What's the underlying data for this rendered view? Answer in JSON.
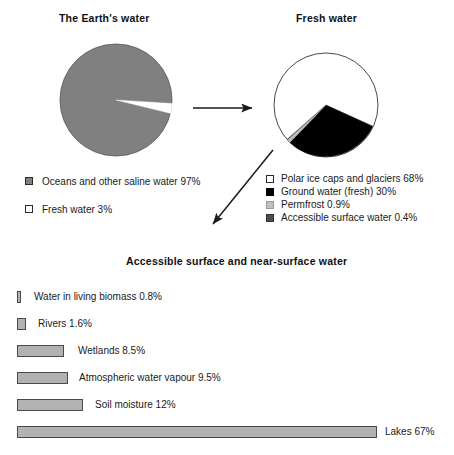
{
  "chart_data": [
    {
      "type": "pie",
      "title": "The Earth's water",
      "xlabel": "",
      "ylabel": "",
      "grid": false,
      "legend_position": "below",
      "labels": [
        "Oceans and other saline water",
        "Fresh water"
      ],
      "values": [
        97,
        3
      ],
      "units": "%",
      "colors": [
        "#808080",
        "#ffffff"
      ],
      "legend": [
        {
          "label": "Oceans and other saline water 97%",
          "color": "#808080"
        },
        {
          "label": "Fresh water 3%",
          "color": "#ffffff"
        }
      ]
    },
    {
      "type": "pie",
      "title": "Fresh water",
      "xlabel": "",
      "ylabel": "",
      "grid": false,
      "legend_position": "below",
      "labels": [
        "Polar ice caps and glaciers",
        "Ground water (fresh)",
        "Permfrost",
        "Accessible surface water"
      ],
      "values": [
        68,
        30,
        0.9,
        0.4
      ],
      "units": "%",
      "colors": [
        "#ffffff",
        "#000000",
        "#bfbfbf",
        "#4d4d4d"
      ],
      "legend": [
        {
          "label": "Polar ice caps and glaciers 68%",
          "color": "#ffffff"
        },
        {
          "label": "Ground water (fresh) 30%",
          "color": "#000000"
        },
        {
          "label": "Permfrost 0.9%",
          "color": "#bfbfbf"
        },
        {
          "label": "Accessible surface water 0.4%",
          "color": "#4d4d4d"
        }
      ]
    },
    {
      "type": "bar",
      "orientation": "horizontal",
      "title": "Accessible surface and near-surface water",
      "xlabel": "",
      "ylabel": "",
      "grid": false,
      "xlim": [
        0,
        67
      ],
      "units": "%",
      "bar_color": "#b2b2b2",
      "categories": [
        "Water in living biomass",
        "Rivers",
        "Wetlands",
        "Atmospheric water vapour",
        "Soil moisture",
        "Lakes"
      ],
      "values": [
        0.8,
        1.6,
        8.5,
        9.5,
        12,
        67
      ],
      "bars": [
        {
          "label": "Water in living biomass 0.8%",
          "value": 0.8,
          "px_width": 4
        },
        {
          "label": "Rivers 1.6%",
          "value": 1.6,
          "px_width": 9
        },
        {
          "label": "Wetlands 8.5%",
          "value": 8.5,
          "px_width": 47
        },
        {
          "label": "Atmospheric water vapour 9.5%",
          "value": 9.5,
          "px_width": 51
        },
        {
          "label": "Soil moisture 12%",
          "value": 12,
          "px_width": 66
        },
        {
          "label": "Lakes 67%",
          "value": 67,
          "px_width": 360
        }
      ]
    }
  ],
  "titles": {
    "earth": "The Earth's water",
    "fresh": "Fresh water",
    "surface": "Accessible surface and near-surface water"
  },
  "annotations": {
    "arrow_earth_to_fresh": "arrow pointing right from The Earth's water pie to Fresh water pie",
    "arrow_fresh_to_surface": "arrow pointing down-left from Fresh water pie to Accessible surface and near-surface water bar chart"
  },
  "colors": {
    "ocean_gray": "#808080",
    "bar_gray": "#b2b2b2",
    "black": "#000000",
    "permafrost_gray": "#bfbfbf",
    "accessible_gray": "#4d4d4d",
    "white": "#ffffff",
    "outline": "#2a2a2a"
  }
}
